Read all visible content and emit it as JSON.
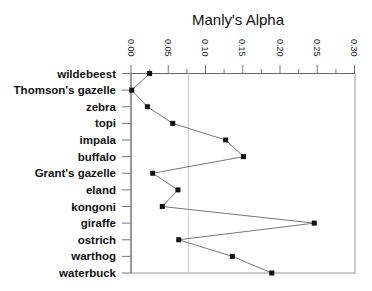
{
  "chart_data": {
    "type": "line",
    "orientation": "horizontal",
    "title": "Manly's Alpha",
    "xlabel": "",
    "ylabel": "",
    "xlim": [
      0.0,
      0.3
    ],
    "x_ticks": [
      "0.00",
      "0.05",
      "0.10",
      "0.15",
      "0.20",
      "0.25",
      "0.30"
    ],
    "x_tick_values": [
      0.0,
      0.05,
      0.1,
      0.15,
      0.2,
      0.25,
      0.3
    ],
    "x_axis_position": "top",
    "reference_line": 0.077,
    "grid": false,
    "legend": null,
    "categories": [
      "wildebeest",
      "Thomson's  gazelle",
      "zebra",
      "topi",
      "impala",
      "buffalo",
      "Grant's  gazelle",
      "eland",
      "kongoni",
      "giraffe",
      "ostrich",
      "warthog",
      "waterbuck"
    ],
    "series": [
      {
        "name": "Manly's Alpha",
        "values": [
          0.025,
          0.001,
          0.022,
          0.056,
          0.127,
          0.151,
          0.029,
          0.063,
          0.042,
          0.246,
          0.064,
          0.136,
          0.189
        ]
      }
    ]
  }
}
